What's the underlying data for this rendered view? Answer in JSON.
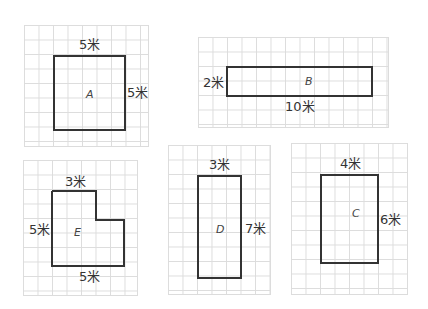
{
  "unit": "米",
  "shapes": [
    {
      "id": "A",
      "name": "A",
      "type": "square",
      "width_label": "5米",
      "height_label": "5米"
    },
    {
      "id": "B",
      "name": "B",
      "type": "rectangle",
      "width_label": "10米",
      "height_label": "2米"
    },
    {
      "id": "C",
      "name": "C",
      "type": "rectangle",
      "width_label": "4米",
      "height_label": "6米"
    },
    {
      "id": "D",
      "name": "D",
      "type": "rectangle",
      "width_label": "3米",
      "height_label": "7米"
    },
    {
      "id": "E",
      "name": "E",
      "type": "L-shape",
      "top_label": "3米",
      "left_label": "5米",
      "bottom_label": "5米"
    }
  ],
  "colors": {
    "grid": "#dcdcdc",
    "stroke": "#333333",
    "background": "#ffffff"
  }
}
